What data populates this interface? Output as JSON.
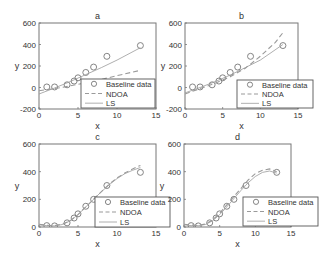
{
  "figure": {
    "background": "#ffffff",
    "axis_color": "#777777",
    "text_color": "#333333",
    "line_color": "#9a9a9a",
    "marker_color": "#777777"
  },
  "legend_labels": [
    "Baseline data",
    "NDOA",
    "LS"
  ],
  "chart_data": [
    {
      "id": "a",
      "type": "line",
      "title": "a",
      "xlabel": "x",
      "ylabel": "y",
      "xlim": [
        0,
        15
      ],
      "ylim": [
        -200,
        600
      ],
      "xticks": [
        0,
        5,
        10,
        15
      ],
      "yticks": [
        -200,
        0,
        200,
        400,
        600
      ],
      "grid": false,
      "legend_position": "lower right",
      "box": {
        "left": 39,
        "top": 23,
        "right": 156,
        "bottom": 109
      },
      "legend_box": {
        "left": 81,
        "top": 79,
        "right": 155,
        "bottom": 108
      },
      "series": [
        {
          "name": "Baseline data",
          "style": "markers",
          "x": [
            1,
            2,
            3.6,
            4.5,
            5,
            6,
            7,
            8.7,
            13
          ],
          "y": [
            5,
            5,
            25,
            60,
            90,
            140,
            190,
            290,
            390
          ]
        },
        {
          "name": "NDOA",
          "style": "dashed",
          "x": [
            0,
            2,
            4,
            6,
            8,
            10,
            13
          ],
          "y": [
            -30,
            -10,
            15,
            45,
            75,
            110,
            160
          ]
        },
        {
          "name": "LS",
          "style": "solid",
          "x": [
            0,
            2,
            4,
            6,
            8,
            10,
            13
          ],
          "y": [
            -60,
            -5,
            55,
            120,
            185,
            255,
            370
          ]
        }
      ]
    },
    {
      "id": "b",
      "type": "line",
      "title": "b",
      "xlabel": "x",
      "ylabel": "y",
      "xlim": [
        0,
        15
      ],
      "ylim": [
        -200,
        600
      ],
      "xticks": [
        0,
        5,
        10,
        15
      ],
      "yticks": [
        -200,
        0,
        200,
        400,
        600
      ],
      "grid": false,
      "legend_position": "lower right",
      "box": {
        "left": 185,
        "top": 23,
        "right": 298,
        "bottom": 109
      },
      "legend_box": {
        "left": 237,
        "top": 80,
        "right": 313,
        "bottom": 108
      },
      "series": [
        {
          "name": "Baseline data",
          "style": "markers",
          "x": [
            1,
            2,
            3.6,
            4.5,
            5,
            6,
            7,
            8.7,
            13
          ],
          "y": [
            5,
            5,
            25,
            60,
            90,
            140,
            190,
            290,
            390
          ]
        },
        {
          "name": "NDOA",
          "style": "dashed",
          "x": [
            0,
            2,
            4,
            6,
            8,
            10,
            12,
            13
          ],
          "y": [
            -60,
            -10,
            40,
            100,
            180,
            290,
            420,
            510
          ]
        },
        {
          "name": "LS",
          "style": "solid",
          "x": [
            0,
            2,
            4,
            6,
            8,
            10,
            13
          ],
          "y": [
            -50,
            0,
            55,
            115,
            185,
            255,
            400
          ]
        }
      ]
    },
    {
      "id": "c",
      "type": "line",
      "title": "c",
      "xlabel": "x",
      "ylabel": "y",
      "xlim": [
        0,
        15
      ],
      "ylim": [
        0,
        600
      ],
      "xticks": [
        0,
        5,
        10,
        15
      ],
      "yticks": [
        0,
        200,
        400,
        600
      ],
      "grid": false,
      "legend_position": "lower right",
      "box": {
        "left": 39,
        "top": 144,
        "right": 156,
        "bottom": 227
      },
      "legend_box": {
        "left": 95,
        "top": 197,
        "right": 170,
        "bottom": 227
      },
      "series": [
        {
          "name": "Baseline data",
          "style": "markers",
          "x": [
            1,
            2,
            3.6,
            4.5,
            5,
            6,
            7,
            8.7,
            13
          ],
          "y": [
            10,
            8,
            30,
            65,
            95,
            150,
            200,
            300,
            395
          ]
        },
        {
          "name": "NDOA",
          "style": "dashed",
          "x": [
            0,
            1,
            2,
            3,
            4,
            5,
            6,
            7,
            8,
            9,
            10,
            11,
            12,
            13
          ],
          "y": [
            20,
            12,
            10,
            20,
            45,
            90,
            145,
            200,
            255,
            310,
            355,
            390,
            420,
            445
          ]
        },
        {
          "name": "LS",
          "style": "solid",
          "x": [
            0,
            1,
            2,
            3,
            4,
            5,
            6,
            7,
            8,
            9,
            10,
            11,
            12,
            13
          ],
          "y": [
            15,
            10,
            8,
            18,
            45,
            90,
            145,
            200,
            255,
            305,
            350,
            385,
            410,
            430
          ]
        }
      ]
    },
    {
      "id": "d",
      "type": "line",
      "title": "d",
      "xlabel": "x",
      "ylabel": "y",
      "xlim": [
        0,
        15
      ],
      "ylim": [
        0,
        600
      ],
      "xticks": [
        0,
        5,
        10,
        15
      ],
      "yticks": [
        0,
        200,
        400,
        600
      ],
      "grid": false,
      "legend_position": "lower right",
      "box": {
        "left": 184,
        "top": 144,
        "right": 291,
        "bottom": 227
      },
      "legend_box": {
        "left": 243,
        "top": 197,
        "right": 318,
        "bottom": 226
      },
      "series": [
        {
          "name": "Baseline data",
          "style": "markers",
          "x": [
            1,
            2,
            3.6,
            4.5,
            5,
            6,
            7,
            8.7,
            13
          ],
          "y": [
            10,
            8,
            30,
            65,
            95,
            150,
            200,
            300,
            395
          ]
        },
        {
          "name": "NDOA",
          "style": "dashed",
          "x": [
            0,
            1,
            2,
            3,
            4,
            5,
            6,
            7,
            8,
            9,
            10,
            11,
            12,
            13
          ],
          "y": [
            20,
            15,
            12,
            22,
            50,
            100,
            160,
            220,
            280,
            340,
            385,
            410,
            420,
            400
          ]
        },
        {
          "name": "LS",
          "style": "solid",
          "x": [
            0,
            1,
            2,
            3,
            4,
            5,
            6,
            7,
            8,
            9,
            10,
            11,
            12,
            13
          ],
          "y": [
            15,
            10,
            10,
            18,
            45,
            90,
            145,
            205,
            265,
            320,
            365,
            395,
            405,
            390
          ]
        }
      ]
    }
  ]
}
